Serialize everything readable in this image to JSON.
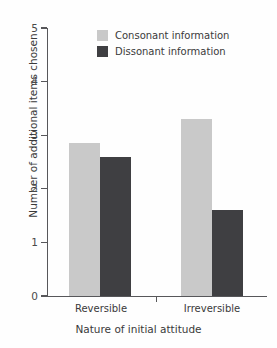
{
  "chart_data": {
    "type": "bar",
    "title": "",
    "xlabel": "Nature of initial attitude",
    "ylabel": "Number of additional items chosen",
    "categories": [
      "Reversible",
      "Irreversible"
    ],
    "series": [
      {
        "name": "Consonant information",
        "color": "#c9c9c9",
        "values": [
          2.85,
          3.3
        ]
      },
      {
        "name": "Dissonant information",
        "color": "#3f3f42",
        "values": [
          2.6,
          1.6
        ]
      }
    ],
    "ylim": [
      0,
      5
    ],
    "yticks": [
      0,
      1,
      2,
      3,
      4,
      5
    ],
    "ytick_labels": [
      "0",
      "1",
      "2",
      "3",
      "4",
      "5"
    ],
    "grid": false,
    "legend_position": "top-center"
  },
  "axes": {
    "y_title": "Number of additional items chosen",
    "x_title": "Nature of initial attitude",
    "y_labels": [
      "5",
      "4",
      "3",
      "2",
      "1",
      "0"
    ]
  },
  "categories": [
    {
      "label": "Reversible"
    },
    {
      "label": "Irreversible"
    }
  ],
  "legend": {
    "entries": [
      {
        "label": "Consonant information",
        "swatch": "legend-swatch-consonant"
      },
      {
        "label": "Dissonant information",
        "swatch": "legend-swatch-dissonant"
      }
    ]
  },
  "colors": {
    "consonant": "#c9c9c9",
    "dissonant": "#3f3f42",
    "axis": "#57575a",
    "text": "#3a3a3a",
    "background": "#fefefe"
  }
}
